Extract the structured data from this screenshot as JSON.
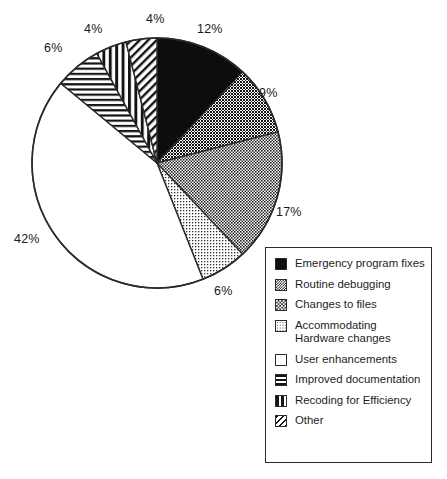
{
  "chart_data": {
    "type": "pie",
    "title": "",
    "subtitle": "",
    "xlabel": "",
    "ylabel": "",
    "legend_position": "bottom-right",
    "grid": false,
    "start_angle_deg": 0,
    "direction": "clockwise",
    "categories": [
      "Emergency program fixes",
      "Routine debugging",
      "Changes to files",
      "Accommodating Hardware changes",
      "User enhancements",
      "Improved documentation",
      "Recoding for Efficiency",
      "Other"
    ],
    "values": [
      12,
      9,
      17,
      6,
      42,
      6,
      4,
      4
    ],
    "value_labels": [
      "12%",
      "9%",
      "17%",
      "6%",
      "42%",
      "6%",
      "4%",
      "4%"
    ],
    "units": "percent",
    "fills": [
      "solid-black",
      "dense-checkerboard",
      "medium-checkerboard",
      "light-dots",
      "white",
      "horizontal-stripes",
      "vertical-stripes",
      "diagonal-hatch"
    ],
    "slices": [
      {
        "label": "Emergency program fixes",
        "value": 12,
        "value_label": "12%",
        "fill": "solid-black"
      },
      {
        "label": "Routine debugging",
        "value": 9,
        "value_label": "9%",
        "fill": "dense-checkerboard"
      },
      {
        "label": "Changes to files",
        "value": 17,
        "value_label": "17%",
        "fill": "medium-checkerboard"
      },
      {
        "label": "Accommodating Hardware changes",
        "value": 6,
        "value_label": "6%",
        "fill": "light-dots"
      },
      {
        "label": "User enhancements",
        "value": 42,
        "value_label": "42%",
        "fill": "white"
      },
      {
        "label": "Improved documentation",
        "value": 6,
        "value_label": "6%",
        "fill": "horizontal-stripes"
      },
      {
        "label": "Recoding for Efficiency",
        "value": 4,
        "value_label": "4%",
        "fill": "vertical-stripes"
      },
      {
        "label": "Other",
        "value": 4,
        "value_label": "4%",
        "fill": "diagonal-hatch"
      }
    ]
  },
  "pie_labels": {
    "emergency": "12%",
    "routine": "9%",
    "changes": "17%",
    "hardware": "6%",
    "user": "42%",
    "documentation": "6%",
    "recoding": "4%",
    "other": "4%"
  },
  "legend": {
    "items": [
      {
        "label": "Emergency program fixes",
        "fill": "solid-black"
      },
      {
        "label": "Routine debugging",
        "fill": "dense-checkerboard"
      },
      {
        "label": "Changes to files",
        "fill": "medium-checkerboard"
      },
      {
        "label": "Accommodating Hardware changes",
        "fill": "light-dots"
      },
      {
        "label": "User enhancements",
        "fill": "white"
      },
      {
        "label": "Improved documentation",
        "fill": "horizontal-stripes"
      },
      {
        "label": "Recoding for Efficiency",
        "fill": "vertical-stripes"
      },
      {
        "label": "Other",
        "fill": "diagonal-hatch"
      }
    ]
  },
  "colors": {
    "outline": "#2b2b2b",
    "text": "#1a1a1a",
    "background": "#ffffff"
  }
}
